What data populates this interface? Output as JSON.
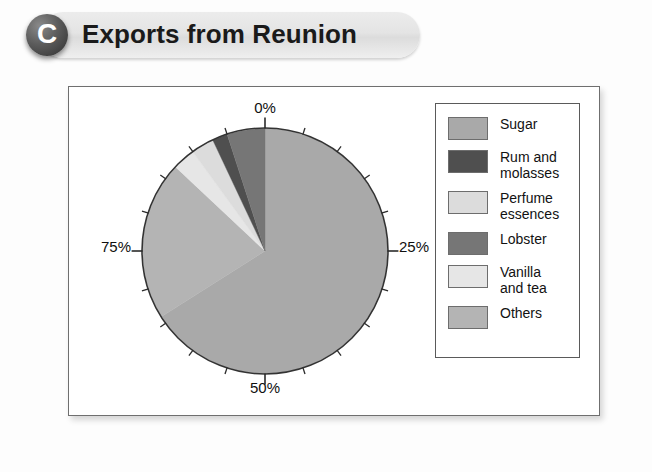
{
  "title": {
    "badge_letter": "C",
    "text": "Exports from Reunion"
  },
  "axis_labels": {
    "top": "0%",
    "right": "25%",
    "bottom": "50%",
    "left": "75%"
  },
  "legend": {
    "items": [
      {
        "label": "Sugar",
        "color": "#a9a9a9"
      },
      {
        "label": "Rum and\nmolasses",
        "color": "#4f4f4f"
      },
      {
        "label": "Perfume\nessences",
        "color": "#dcdcdc"
      },
      {
        "label": "Lobster",
        "color": "#767676"
      },
      {
        "label": "Vanilla\nand tea",
        "color": "#e6e6e6"
      },
      {
        "label": "Others",
        "color": "#b4b4b4"
      }
    ]
  },
  "chart_data": {
    "type": "pie",
    "title": "Exports from Reunion",
    "unit": "percent",
    "start_angle_deg": 0,
    "direction": "clockwise",
    "grid": false,
    "legend_position": "right",
    "axis_tick_labels": [
      "0%",
      "25%",
      "50%",
      "75%"
    ],
    "tick_interval_percent": 5,
    "categories": [
      "Sugar",
      "Others",
      "Vanilla and tea",
      "Perfume essences",
      "Rum and molasses",
      "Lobster"
    ],
    "values": [
      66,
      21,
      3,
      3,
      2,
      5
    ],
    "colors": [
      "#a9a9a9",
      "#b4b4b4",
      "#e6e6e6",
      "#dcdcdc",
      "#4f4f4f",
      "#767676"
    ],
    "slices": [
      {
        "name": "Sugar",
        "value": 66,
        "start_percent": 0,
        "end_percent": 66,
        "color": "#a9a9a9"
      },
      {
        "name": "Others",
        "value": 21,
        "start_percent": 66,
        "end_percent": 87,
        "color": "#b4b4b4"
      },
      {
        "name": "Vanilla and tea",
        "value": 3,
        "start_percent": 87,
        "end_percent": 90,
        "color": "#e6e6e6"
      },
      {
        "name": "Perfume essences",
        "value": 3,
        "start_percent": 90,
        "end_percent": 93,
        "color": "#dcdcdc"
      },
      {
        "name": "Rum and molasses",
        "value": 2,
        "start_percent": 93,
        "end_percent": 95,
        "color": "#4f4f4f"
      },
      {
        "name": "Lobster",
        "value": 5,
        "start_percent": 95,
        "end_percent": 100,
        "color": "#767676"
      }
    ]
  }
}
